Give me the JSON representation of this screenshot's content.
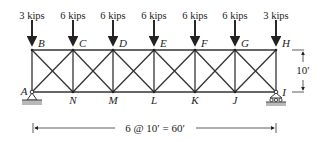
{
  "diagram": {
    "type": "truss",
    "loads": [
      {
        "node": "B",
        "label": "3 kips"
      },
      {
        "node": "C",
        "label": "6 kips"
      },
      {
        "node": "D",
        "label": "6 kips"
      },
      {
        "node": "E",
        "label": "6 kips"
      },
      {
        "node": "F",
        "label": "6 kips"
      },
      {
        "node": "G",
        "label": "6 kips"
      },
      {
        "node": "H",
        "label": "3 kips"
      }
    ],
    "top_nodes": [
      "B",
      "C",
      "D",
      "E",
      "F",
      "G",
      "H"
    ],
    "bottom_nodes": [
      "A",
      "N",
      "M",
      "L",
      "K",
      "J",
      "I"
    ],
    "height_label": "10′",
    "span_label": "6 @ 10′ = 60′",
    "supports": {
      "left": "pin (A)",
      "right": "roller (I)"
    }
  }
}
